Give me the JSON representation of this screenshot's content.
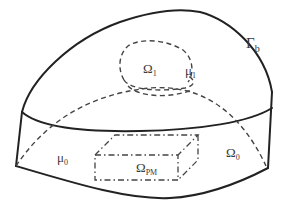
{
  "diagram": {
    "type": "domain-geometry",
    "labels": {
      "boundary": "Γ",
      "boundary_sub": "b",
      "inner_region": "Ω",
      "inner_region_sub": "1",
      "inner_perm": "μ",
      "inner_perm_sub": "1",
      "outer_perm": "μ",
      "outer_perm_sub": "0",
      "outer_region": "Ω",
      "outer_region_sub": "0",
      "pm_region": "Ω",
      "pm_region_sub": "PM"
    },
    "colors": {
      "stroke": "#222222",
      "dashed": "#444444",
      "text": "#3a3a3a",
      "background": "#ffffff"
    }
  }
}
